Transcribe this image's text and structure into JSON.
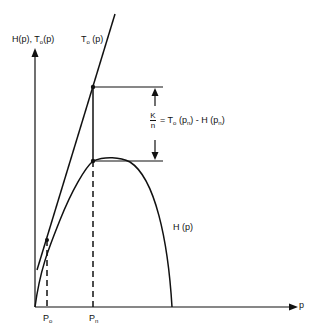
{
  "diagram": {
    "y_axis_label_H": "H(p),",
    "y_axis_label_T": "T",
    "y_axis_label_T_sub": "o",
    "y_axis_label_T_arg": "(p)",
    "x_axis_label": "p",
    "tangent_label": "T",
    "tangent_label_sub": "o",
    "tangent_label_arg": "(p)",
    "curve_label": "H (p)",
    "equation": {
      "numerator": "K",
      "denominator": "n",
      "rhs_prefix": "= T",
      "rhs_T_sub": "o",
      "rhs_mid": " (p",
      "rhs_pn_sub": "n",
      "rhs_mid2": ") - H (p",
      "rhs_pn_sub2": "n",
      "rhs_end": ")"
    },
    "x_ticks": [
      {
        "main": "P",
        "sub": "o"
      },
      {
        "main": "P",
        "sub": "n"
      }
    ]
  }
}
